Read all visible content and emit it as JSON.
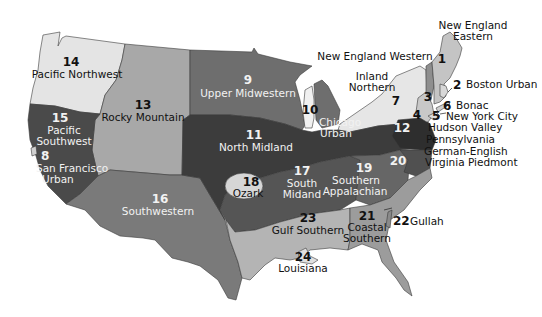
{
  "map": {
    "regions": [
      {
        "id": 1,
        "number": "1",
        "name": "New England Eastern",
        "label_lines": [
          "New England",
          "Eastern"
        ],
        "fill": "#c4c4c4"
      },
      {
        "id": 2,
        "number": "2",
        "name": "Boston Urban",
        "label_lines": [
          "Boston Urban"
        ],
        "fill": "#d8d8d8"
      },
      {
        "id": 3,
        "number": "3",
        "name": "New England Western",
        "label_lines": [
          "New England Western"
        ],
        "fill": "#8e8e8e"
      },
      {
        "id": 4,
        "number": "4",
        "name": "Hudson Valley",
        "label_lines": [
          "Hudson Valley"
        ],
        "fill": "#c8c8c8"
      },
      {
        "id": 5,
        "number": "5",
        "name": "New York City",
        "label_lines": [
          "New York City"
        ],
        "fill": "#dcdcdc"
      },
      {
        "id": 6,
        "number": "6",
        "name": "Bonac",
        "label_lines": [
          "Bonac"
        ],
        "fill": "#d0d0d0"
      },
      {
        "id": 7,
        "number": "7",
        "name": "Inland Northern",
        "label_lines": [
          "Inland",
          "Northern"
        ],
        "fill": "#e6e6e6"
      },
      {
        "id": 8,
        "number": "8",
        "name": "San Francisco Urban",
        "label_lines": [
          "San Francisco",
          "Urban"
        ],
        "fill": "#d0d0d0"
      },
      {
        "id": 9,
        "number": "9",
        "name": "Upper Midwestern",
        "label_lines": [
          "Upper Midwestern"
        ],
        "fill": "#6e6e6e"
      },
      {
        "id": 10,
        "number": "10",
        "name": "Chicago Urban",
        "label_lines": [
          "Chicago",
          "Urban"
        ],
        "fill": "#f0f0f0"
      },
      {
        "id": 11,
        "number": "11",
        "name": "North Midland",
        "label_lines": [
          "North Midland"
        ],
        "fill": "#3c3c3c"
      },
      {
        "id": 12,
        "number": "12",
        "name": "Pennsylvania German-English",
        "label_lines": [
          "Pennsylvania",
          "German-English"
        ],
        "fill": "#2e2e2e"
      },
      {
        "id": 13,
        "number": "13",
        "name": "Rocky Mountain",
        "label_lines": [
          "Rocky Mountain"
        ],
        "fill": "#a8a8a8"
      },
      {
        "id": 14,
        "number": "14",
        "name": "Pacific Northwest",
        "label_lines": [
          "Pacific Northwest"
        ],
        "fill": "#e4e4e4"
      },
      {
        "id": 15,
        "number": "15",
        "name": "Pacific Southwest",
        "label_lines": [
          "Pacific",
          "Southwest"
        ],
        "fill": "#4a4a4a"
      },
      {
        "id": 16,
        "number": "16",
        "name": "Southwestern",
        "label_lines": [
          "Southwestern"
        ],
        "fill": "#7a7a7a"
      },
      {
        "id": 17,
        "number": "17",
        "name": "South Midand",
        "label_lines": [
          "South",
          "Midand"
        ],
        "fill": "#555555"
      },
      {
        "id": 18,
        "number": "18",
        "name": "Ozark",
        "label_lines": [
          "Ozark"
        ],
        "fill": "#d6d6d6"
      },
      {
        "id": 19,
        "number": "19",
        "name": "Southern Appalachian",
        "label_lines": [
          "Southern",
          "Appalachian"
        ],
        "fill": "#666666"
      },
      {
        "id": 20,
        "number": "20",
        "name": "Virginia Piedmont",
        "label_lines": [
          "Virginia Piedmont"
        ],
        "fill": "#505050"
      },
      {
        "id": 21,
        "number": "21",
        "name": "Coastal Southern",
        "label_lines": [
          "Coastal",
          "Southern"
        ],
        "fill": "#9c9c9c"
      },
      {
        "id": 22,
        "number": "22",
        "name": "Gullah",
        "label_lines": [
          "Gullah"
        ],
        "fill": "#8a8a8a"
      },
      {
        "id": 23,
        "number": "23",
        "name": "Gulf Southern",
        "label_lines": [
          "Gulf Southern"
        ],
        "fill": "#b4b4b4"
      },
      {
        "id": 24,
        "number": "24",
        "name": "Louisiana",
        "label_lines": [
          "Louisiana"
        ],
        "fill": "#e0e0e0"
      }
    ]
  }
}
